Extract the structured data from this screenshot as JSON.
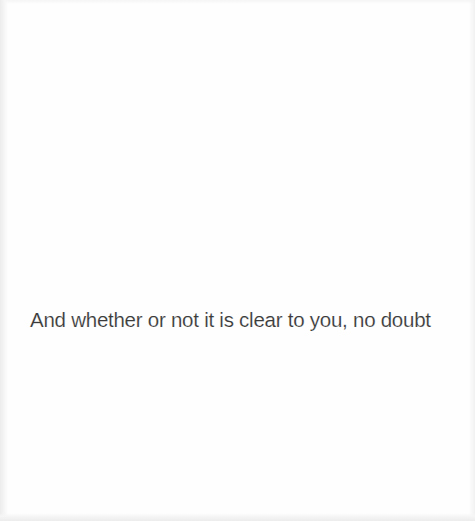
{
  "page": {
    "background_color": "#fefefe",
    "text_color": "#3a3a3a"
  },
  "caption": {
    "text": "And whether or not it is clear to you, no doubt"
  }
}
